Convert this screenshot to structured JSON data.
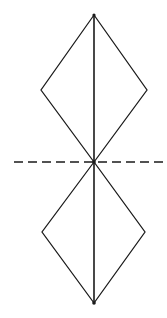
{
  "figure": {
    "background_color": "#ffffff",
    "stroke_color": "#1a1a1a",
    "canvas": {
      "width": 167,
      "height": 318
    },
    "points": {
      "top_apex": {
        "label": "top apex",
        "x": 94,
        "y": 15
      },
      "upper_left": {
        "label": "upper left vertex",
        "x": 41,
        "y": 90
      },
      "upper_right": {
        "label": "upper right vertex",
        "x": 147,
        "y": 90
      },
      "center": {
        "label": "center node",
        "x": 94,
        "y": 162
      },
      "lower_left": {
        "label": "lower left vertex",
        "x": 42,
        "y": 232
      },
      "lower_right": {
        "label": "lower right vertex",
        "x": 145,
        "y": 232
      },
      "bottom_apex": {
        "label": "bottom apex",
        "x": 94,
        "y": 303
      }
    },
    "shapes": {
      "upper_kite": {
        "name": "upper kite outline",
        "path": "M 94 15 L 41 90 L 94 162 L 147 90 Z"
      },
      "lower_kite": {
        "name": "lower kite outline",
        "path": "M 94 162 L 42 232 L 94 303 L 145 232 Z"
      },
      "vertical_axis": {
        "name": "vertical symmetry axis",
        "path": "M 94 15 L 94 303"
      },
      "dashed_axis": {
        "name": "horizontal dashed axis",
        "path": "M 14 162 L 163 162",
        "dash_pattern": "9 5"
      }
    }
  }
}
